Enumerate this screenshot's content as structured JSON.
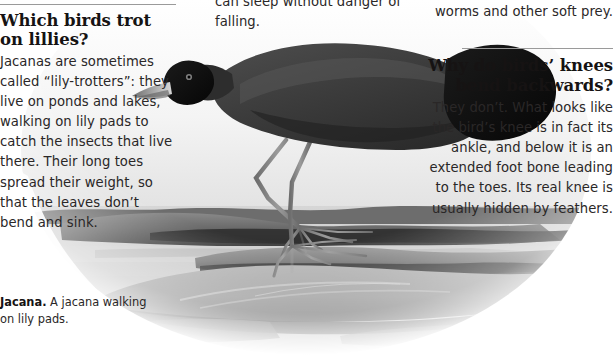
{
  "page": {
    "width": 613,
    "height": 357,
    "background": "#ffffff",
    "text_color": "#2a2727",
    "heading_color": "#161313",
    "rule_color": "#9a9a9a"
  },
  "columns": {
    "left": {
      "heading": "Which birds trot on lillies?",
      "body": "Jacanas are sometimes called “lily-trotters”: they live on ponds and lakes, walking on lily pads to catch the insects that live there. Their long toes spread their weight, so that the leaves don’t bend and sink."
    },
    "middle": {
      "body": "can sleep without danger of falling."
    },
    "right": {
      "continuation": "worms and other soft prey.",
      "heading": "Why do birds’ knees bend backwards?",
      "body": "They don’t. What looks like the bird’s knee is in fact its ankle, and below it is an extended foot bone leading to the toes. Its real knee is usually hidden by feathers."
    }
  },
  "caption": {
    "lead": "Jacana.",
    "text": " A jacana walking on lily pads."
  },
  "figure": {
    "name": "jacana-walking-on-lily-pads-photo",
    "alt": "Black-and-white photograph of a dark jacana bird with very long legs and long toes walking across floating lily pads on water",
    "tones": {
      "bird_body": "#3b3b3b",
      "bird_head": "#101010",
      "beak": "#8f8f8f",
      "legs": "#7e7e7e",
      "water": "#dcdcdc",
      "pad_dark": "#4a4a4a",
      "pad_mid": "#7d7d7d"
    }
  }
}
